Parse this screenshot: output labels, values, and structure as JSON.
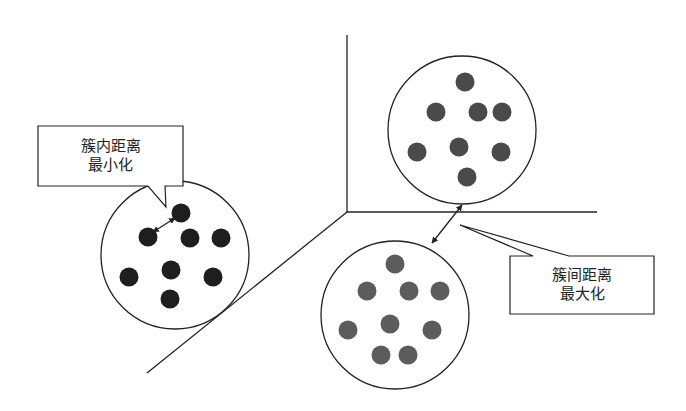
{
  "diagram": {
    "type": "clustering-concept",
    "callouts": {
      "intra": {
        "line1": "簇内距离",
        "line2": "最小化"
      },
      "inter": {
        "line1": "簇间距离",
        "line2": "最大化"
      }
    },
    "clusters": [
      {
        "name": "cluster-left",
        "center": [
          175,
          255
        ],
        "radius": 74,
        "dot_color": "#1e1e1e",
        "points": [
          [
            181,
            213
          ],
          [
            148,
            237
          ],
          [
            190,
            238
          ],
          [
            221,
            238
          ],
          [
            129,
            277
          ],
          [
            171,
            270
          ],
          [
            213,
            277
          ],
          [
            170,
            299
          ]
        ]
      },
      {
        "name": "cluster-top-right",
        "center": [
          462,
          130
        ],
        "radius": 74,
        "dot_color": "#4a4a4a",
        "points": [
          [
            465,
            82
          ],
          [
            436,
            112
          ],
          [
            478,
            112
          ],
          [
            502,
            112
          ],
          [
            417,
            152
          ],
          [
            459,
            147
          ],
          [
            501,
            152
          ],
          [
            467,
            177
          ]
        ]
      },
      {
        "name": "cluster-bottom",
        "center": [
          395,
          315
        ],
        "radius": 74,
        "dot_color": "#5c5c5c",
        "points": [
          [
            395,
            264
          ],
          [
            367,
            291
          ],
          [
            409,
            291
          ],
          [
            440,
            291
          ],
          [
            348,
            330
          ],
          [
            390,
            324
          ],
          [
            432,
            330
          ],
          [
            381,
            355
          ],
          [
            408,
            355
          ]
        ]
      }
    ],
    "colors": {
      "stroke": "#222222",
      "background": "#ffffff"
    }
  }
}
